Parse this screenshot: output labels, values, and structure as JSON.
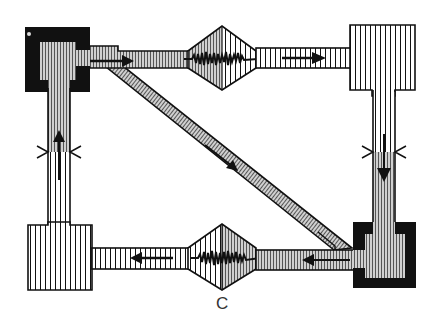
{
  "figure": {
    "label": "C"
  },
  "colors": {
    "ink": "#111111",
    "shaded_fill": "#b8b8b8",
    "light_fill": "#ffffff",
    "label": "#333333"
  },
  "nodes": [
    {
      "id": "top-left-reservoir",
      "style": "filled-black-with-shaded-interior"
    },
    {
      "id": "top-right-reservoir",
      "style": "hatched-white"
    },
    {
      "id": "bottom-right-reservoir",
      "style": "filled-black-with-shaded-interior"
    },
    {
      "id": "bottom-left-reservoir",
      "style": "hatched-white"
    },
    {
      "id": "top-diamond-chamber",
      "style": "half-shaded-with-noise"
    },
    {
      "id": "bottom-diamond-chamber",
      "style": "half-shaded-with-noise"
    }
  ],
  "flows": [
    {
      "from": "top-left-reservoir",
      "to": "top-right-reservoir",
      "via": "top-diamond-chamber",
      "direction": "right"
    },
    {
      "from": "top-right-reservoir",
      "to": "bottom-right-reservoir",
      "direction": "down",
      "constriction": true
    },
    {
      "from": "bottom-right-reservoir",
      "to": "bottom-left-reservoir",
      "via": "bottom-diamond-chamber",
      "direction": "left"
    },
    {
      "from": "bottom-left-reservoir",
      "to": "top-left-reservoir",
      "direction": "up",
      "constriction": true
    },
    {
      "from": "bottom-right-reservoir",
      "to": "top-left-reservoir",
      "via": "diagonal-channel",
      "direction": "up-left"
    }
  ]
}
